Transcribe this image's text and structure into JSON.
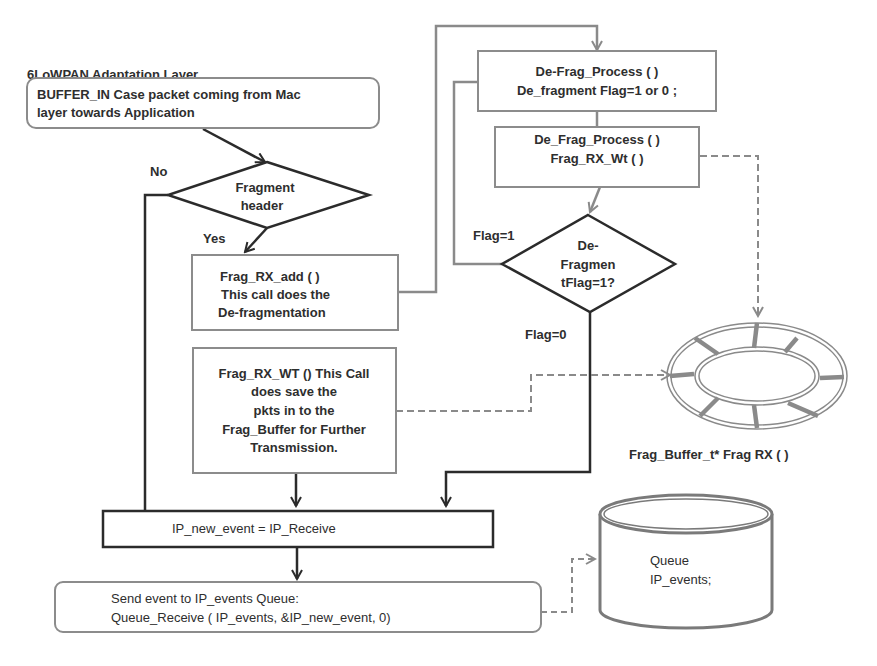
{
  "title": "6LoWPAN Adaptation Layer",
  "nodes": {
    "buffer_in": {
      "lines": [
        "BUFFER_IN Case  packet  coming from Mac",
        "layer towards Application"
      ]
    },
    "fragment_header": {
      "lines": [
        "Fragment",
        "header"
      ]
    },
    "frag_rx_add": {
      "lines": [
        "Frag_RX_add ( )",
        "This call does the",
        "De-fragmentation"
      ]
    },
    "frag_rx_wt": {
      "lines": [
        "Frag_RX_WT () This Call",
        "does save the",
        "pkts in to the",
        "Frag_Buffer for Further",
        "Transmission."
      ]
    },
    "de_frag_process_1": {
      "lines": [
        "De-Frag_Process ( )",
        "De_fragment Flag=1 or 0 ;"
      ]
    },
    "de_frag_process_2": {
      "lines": [
        "De_Frag_Process ( )",
        "Frag_RX_Wt ( )"
      ]
    },
    "defragment_flag": {
      "lines": [
        "De-",
        "Fragmen",
        "tFlag=1?"
      ]
    },
    "ip_new_event": {
      "lines": [
        "IP_new_event = IP_Receive"
      ]
    },
    "send_event": {
      "lines": [
        "Send event to IP_events Queue:",
        "Queue_Receive ( IP_events,  &IP_new_event, 0)"
      ]
    },
    "queue": {
      "lines": [
        "Queue",
        "IP_events;"
      ]
    },
    "frag_buffer": {
      "label": "Frag_Buffer_t*  Frag RX ( )"
    }
  },
  "edge_labels": {
    "no": "No",
    "yes": "Yes",
    "flag1": "Flag=1",
    "flag0": "Flag=0"
  },
  "colors": {
    "dark_line": "#2b2b2b",
    "gray_line": "#8a8a8a",
    "box_border": "#8c8c8c"
  }
}
